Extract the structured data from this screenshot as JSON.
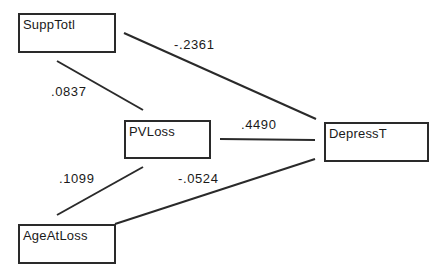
{
  "diagram": {
    "type": "path-diagram",
    "nodes": [
      {
        "id": "supptotl",
        "label": "SuppTotl"
      },
      {
        "id": "pvloss",
        "label": "PVLoss"
      },
      {
        "id": "depresst",
        "label": "DepressT"
      },
      {
        "id": "ageatloss",
        "label": "AgeAtLoss"
      }
    ],
    "edges": [
      {
        "from": "SuppTotl",
        "to": "DepressT",
        "coefficient": "-.2361"
      },
      {
        "from": "SuppTotl",
        "to": "PVLoss",
        "coefficient": ".0837"
      },
      {
        "from": "PVLoss",
        "to": "DepressT",
        "coefficient": ".4490"
      },
      {
        "from": "AgeAtLoss",
        "to": "PVLoss",
        "coefficient": ".1099"
      },
      {
        "from": "AgeAtLoss",
        "to": "DepressT",
        "coefficient": "-.0524"
      }
    ]
  }
}
